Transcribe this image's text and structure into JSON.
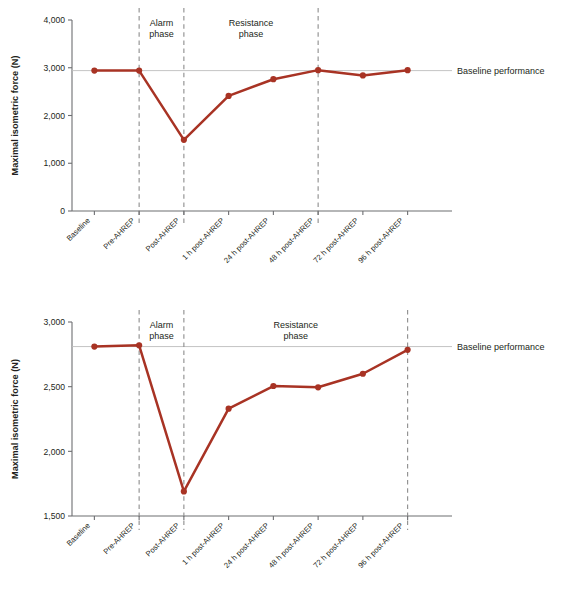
{
  "figure": {
    "yaxis_title": "Maximal isometric force (N)",
    "series_color": "#a83324",
    "baseline_rule_color": "#bcbcbc",
    "divider_color": "#8c8c8c",
    "axis_color": "#6d6e71"
  },
  "labels": {
    "alarm_phase": "Alarm\nphase",
    "alarm_phase_line1": "Alarm",
    "alarm_phase_line2": "phase",
    "resistance_phase_line1": "Resistance",
    "resistance_phase_line2": "phase",
    "baseline_performance": "Baseline performance"
  },
  "chart_data": [
    {
      "type": "line",
      "id": "panel-top",
      "title": "",
      "xlabel": "",
      "ylabel": "Maximal isometric force (N)",
      "ylim": [
        0,
        4000
      ],
      "yticks": [
        0,
        1000,
        2000,
        3000,
        4000
      ],
      "ytick_labels": [
        "0",
        "1,000",
        "2,000",
        "3,000",
        "4,000"
      ],
      "grid": false,
      "legend": "none",
      "categories": [
        "Baseline",
        "Pre-AHREP",
        "Post-AHREP",
        "1 h post-AHREP",
        "24 h post-AHREP",
        "48 h post-AHREP",
        "72 h post-AHREP",
        "96 h post-AHREP"
      ],
      "values": [
        2940,
        2940,
        1490,
        2410,
        2760,
        2950,
        2840,
        2950
      ],
      "baseline_reference": 2940,
      "annotations": [
        {
          "text": "Alarm phase",
          "between": [
            "Pre-AHREP",
            "Post-AHREP"
          ]
        },
        {
          "text": "Resistance phase",
          "between": [
            "Post-AHREP",
            "48 h post-AHREP"
          ]
        },
        {
          "text": "Baseline performance",
          "at_y": 2940
        }
      ],
      "dividers_at": [
        "Pre-AHREP",
        "Post-AHREP",
        "48 h post-AHREP"
      ]
    },
    {
      "type": "line",
      "id": "panel-bottom",
      "title": "",
      "xlabel": "",
      "ylabel": "Maximal isometric force (N)",
      "ylim": [
        1500,
        3000
      ],
      "yticks": [
        1500,
        2000,
        2500,
        3000
      ],
      "ytick_labels": [
        "1,500",
        "2,000",
        "2,500",
        "3,000"
      ],
      "grid": false,
      "legend": "none",
      "categories": [
        "Baseline",
        "Pre-AHREP",
        "Post-AHREP",
        "1 h post-AHREP",
        "24 h post-AHREP",
        "48 h post-AHREP",
        "72 h post-AHREP",
        "96 h post-AHREP"
      ],
      "values": [
        2810,
        2820,
        1690,
        2330,
        2505,
        2495,
        2600,
        2785
      ],
      "baseline_reference": 2810,
      "annotations": [
        {
          "text": "Alarm phase",
          "between": [
            "Pre-AHREP",
            "Post-AHREP"
          ]
        },
        {
          "text": "Resistance phase",
          "between": [
            "Post-AHREP",
            "96 h post-AHREP"
          ]
        },
        {
          "text": "Baseline performance",
          "at_y": 2810
        }
      ],
      "dividers_at": [
        "Pre-AHREP",
        "Post-AHREP",
        "96 h post-AHREP"
      ]
    }
  ]
}
